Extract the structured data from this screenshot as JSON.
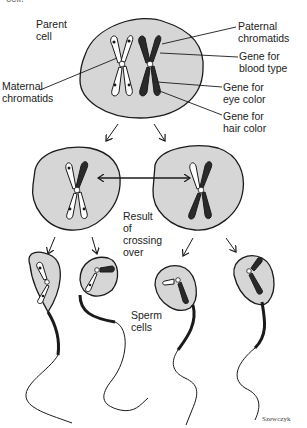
{
  "caption_fragment": "cell.",
  "labels": {
    "parent_cell": "Parent\ncell",
    "maternal_chromatids": "Maternal\nchromatids",
    "paternal_chromatids": "Paternal\nchromatids",
    "gene_blood_type": "Gene for\nblood type",
    "gene_eye_color": "Gene for\neye color",
    "gene_hair_color": "Gene for\nhair color",
    "result_crossing_over": "Result\nof\ncrossing\nover",
    "sperm_cells": "Sperm\ncells"
  },
  "signature": "Szewczyk",
  "colors": {
    "cell_fill": "#d6d6d6",
    "outline": "#1a1a1a",
    "paternal": "#2a2a2a",
    "maternal": "#ffffff"
  }
}
